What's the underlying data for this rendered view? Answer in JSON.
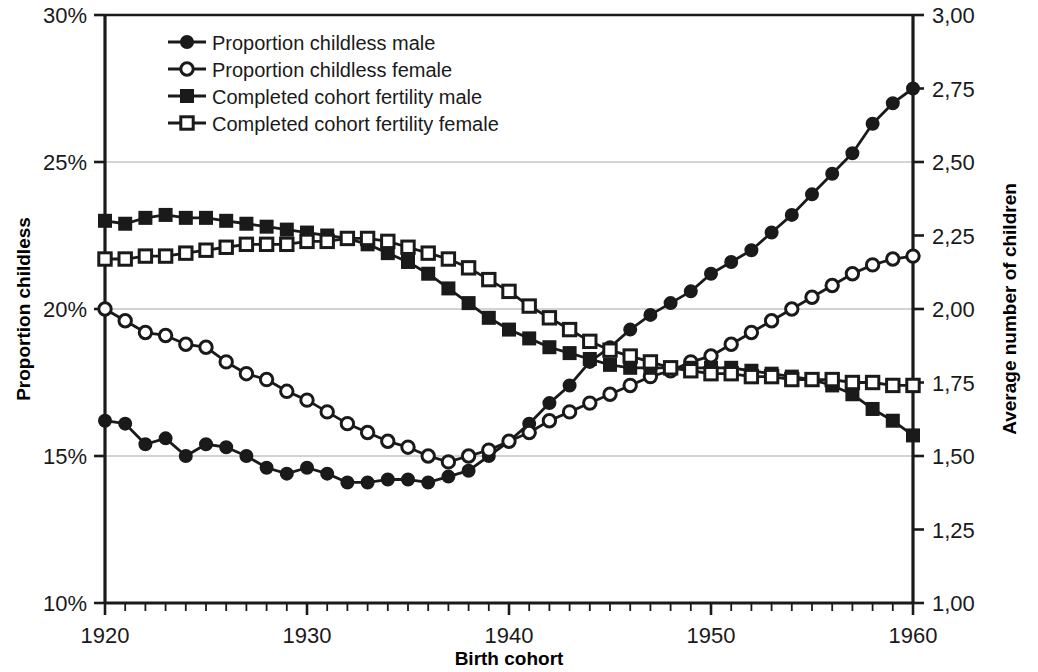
{
  "chart_data": {
    "type": "line",
    "title": "",
    "xlabel": "Birth cohort",
    "ylabel": "Proportion childless",
    "y2label": "Average number of children",
    "xlim": [
      1920,
      1960
    ],
    "ylim": [
      10,
      30
    ],
    "y2lim": [
      1.0,
      3.0
    ],
    "xticks": [
      1920,
      1930,
      1940,
      1950,
      1960
    ],
    "xtick_labels": [
      "1920",
      "1930",
      "1940",
      "1950",
      "1960"
    ],
    "yticks": [
      10,
      15,
      20,
      25,
      30
    ],
    "ytick_labels": [
      "10%",
      "15%",
      "20%",
      "25%",
      "30%"
    ],
    "y2ticks": [
      1.0,
      1.25,
      1.5,
      1.75,
      2.0,
      2.25,
      2.5,
      2.75,
      3.0
    ],
    "y2tick_labels": [
      "1,00",
      "1,25",
      "1,50",
      "1,75",
      "2,00",
      "2,25",
      "2,50",
      "2,75",
      "3,00"
    ],
    "grid": "horizontal-major",
    "legend_position": "top-left-inside",
    "x": [
      1920,
      1921,
      1922,
      1923,
      1924,
      1925,
      1926,
      1927,
      1928,
      1929,
      1930,
      1931,
      1932,
      1933,
      1934,
      1935,
      1936,
      1937,
      1938,
      1939,
      1940,
      1941,
      1942,
      1943,
      1944,
      1945,
      1946,
      1947,
      1948,
      1949,
      1950,
      1951,
      1952,
      1953,
      1954,
      1955,
      1956,
      1957,
      1958,
      1959,
      1960
    ],
    "series": [
      {
        "name": "Proportion childless male",
        "axis": "left",
        "marker": "filled-circle",
        "unit": "%",
        "values": [
          16.2,
          16.1,
          15.4,
          15.6,
          15.0,
          15.4,
          15.3,
          15.0,
          14.6,
          14.4,
          14.6,
          14.4,
          14.1,
          14.1,
          14.2,
          14.2,
          14.1,
          14.3,
          14.5,
          15.0,
          15.5,
          16.1,
          16.8,
          17.4,
          18.2,
          18.7,
          19.3,
          19.8,
          20.2,
          20.6,
          21.2,
          21.6,
          22.0,
          22.6,
          23.2,
          23.9,
          24.6,
          25.3,
          26.3,
          27.0,
          27.5
        ]
      },
      {
        "name": "Proportion childless female",
        "axis": "left",
        "marker": "open-circle",
        "unit": "%",
        "values": [
          20.0,
          19.6,
          19.2,
          19.1,
          18.8,
          18.7,
          18.2,
          17.8,
          17.6,
          17.2,
          16.9,
          16.5,
          16.1,
          15.8,
          15.5,
          15.3,
          15.0,
          14.8,
          15.0,
          15.2,
          15.5,
          15.8,
          16.2,
          16.5,
          16.8,
          17.1,
          17.4,
          17.7,
          17.9,
          18.2,
          18.4,
          18.8,
          19.2,
          19.6,
          20.0,
          20.4,
          20.8,
          21.2,
          21.5,
          21.7,
          21.8
        ]
      },
      {
        "name": "Completed cohort fertility male",
        "axis": "right",
        "marker": "filled-square",
        "unit": "children",
        "values": [
          2.3,
          2.29,
          2.31,
          2.32,
          2.31,
          2.31,
          2.3,
          2.29,
          2.28,
          2.27,
          2.26,
          2.25,
          2.24,
          2.22,
          2.19,
          2.16,
          2.12,
          2.07,
          2.02,
          1.97,
          1.93,
          1.9,
          1.87,
          1.85,
          1.83,
          1.81,
          1.8,
          1.8,
          1.8,
          1.8,
          1.8,
          1.8,
          1.79,
          1.78,
          1.77,
          1.76,
          1.74,
          1.71,
          1.66,
          1.62,
          1.57
        ]
      },
      {
        "name": "Completed cohort fertility female",
        "axis": "right",
        "marker": "open-square",
        "unit": "children",
        "values": [
          2.17,
          2.17,
          2.18,
          2.18,
          2.19,
          2.2,
          2.21,
          2.22,
          2.22,
          2.22,
          2.23,
          2.23,
          2.24,
          2.24,
          2.23,
          2.21,
          2.19,
          2.17,
          2.14,
          2.1,
          2.06,
          2.01,
          1.97,
          1.93,
          1.89,
          1.86,
          1.84,
          1.82,
          1.8,
          1.79,
          1.78,
          1.78,
          1.77,
          1.77,
          1.76,
          1.76,
          1.76,
          1.75,
          1.75,
          1.74,
          1.74
        ]
      }
    ]
  },
  "legend": {
    "items": [
      {
        "label": "Proportion childless male",
        "marker": "filled-circle"
      },
      {
        "label": "Proportion childless female",
        "marker": "open-circle"
      },
      {
        "label": "Completed cohort fertility male",
        "marker": "filled-square"
      },
      {
        "label": "Completed cohort fertility female",
        "marker": "open-square"
      }
    ]
  },
  "colors": {
    "line": "#1a1a1a",
    "grid": "#a8a8a8",
    "axis": "#1a1a1a",
    "background": "#ffffff"
  }
}
